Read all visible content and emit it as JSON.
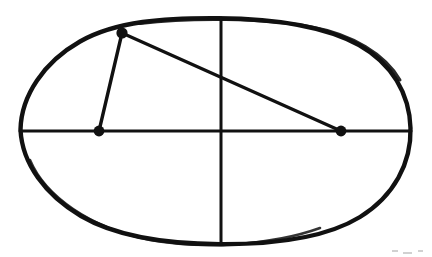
{
  "figure": {
    "kind": "geometric-line-drawing",
    "style": "hand-drawn ink on white paper",
    "canvas": {
      "width": 432,
      "height": 257,
      "background": "#ffffff"
    },
    "ink_color": "#111111",
    "stroke_widths": {
      "ellipse": 4.2,
      "axis": 3.0,
      "chord": 3.2
    },
    "point_radius": 5.2
  },
  "chart_data": {
    "type": "scatter",
    "xlabel": "",
    "ylabel": "",
    "xlim": [
      0,
      432
    ],
    "ylim": [
      257,
      0
    ],
    "grid": false,
    "legend": "none",
    "shapes": [
      {
        "name": "ellipse-outline",
        "type": "ellipse",
        "cx": 221,
        "cy": 131,
        "rx": 195,
        "ry": 113,
        "filled": false,
        "stroke": "#111111"
      },
      {
        "name": "major-axis",
        "type": "line",
        "x1": 20,
        "y1": 131,
        "x2": 411,
        "y2": 131,
        "stroke": "#111111"
      },
      {
        "name": "minor-axis",
        "type": "line",
        "x1": 221,
        "y1": 18,
        "x2": 221,
        "y2": 244,
        "stroke": "#111111"
      },
      {
        "name": "segment-top-to-left-point",
        "type": "line",
        "x1": 122,
        "y1": 33,
        "x2": 99,
        "y2": 131,
        "stroke": "#111111"
      },
      {
        "name": "chord-top-to-right-point",
        "type": "line",
        "x1": 122,
        "y1": 33,
        "x2": 341,
        "y2": 131,
        "stroke": "#111111"
      }
    ],
    "points": [
      {
        "name": "point-on-ellipse",
        "x": 122,
        "y": 33,
        "marker": "filled-circle",
        "label": ""
      },
      {
        "name": "point-left-on-axis",
        "x": 99,
        "y": 131,
        "marker": "filled-circle",
        "label": ""
      },
      {
        "name": "point-right-on-axis",
        "x": 341,
        "y": 131,
        "marker": "filled-circle",
        "label": ""
      }
    ],
    "annotations": []
  }
}
